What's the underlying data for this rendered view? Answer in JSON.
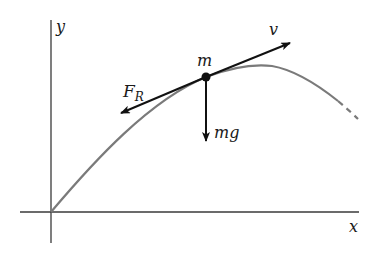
{
  "diagram": {
    "type": "projectile-force-diagram",
    "axes": {
      "x_label": "x",
      "y_label": "y"
    },
    "mass_label": "m",
    "vectors": {
      "velocity": {
        "label": "v",
        "direction": "tangent to path, forward"
      },
      "drag_force": {
        "label_main": "F",
        "label_sub": "R",
        "direction": "tangent to path, backward"
      },
      "gravity": {
        "label": "mg",
        "direction": "downward"
      }
    },
    "colors": {
      "axes": "#3a3a3a",
      "trajectory": "#7a7a7a",
      "vectors": "#111111",
      "background": "#ffffff"
    }
  }
}
